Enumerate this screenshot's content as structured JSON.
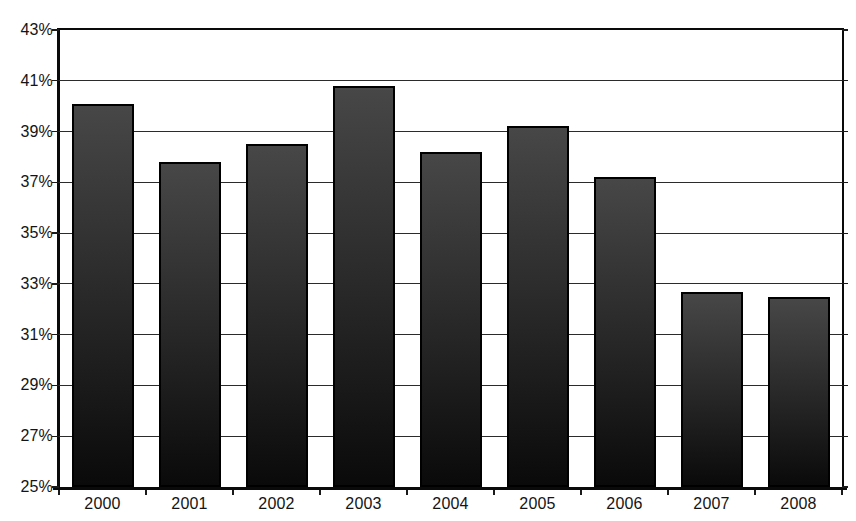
{
  "chart_data": {
    "type": "bar",
    "title": "",
    "xlabel": "",
    "ylabel": "",
    "categories": [
      "2000",
      "2001",
      "2002",
      "2003",
      "2004",
      "2005",
      "2006",
      "2007",
      "2008"
    ],
    "values": [
      40.1,
      37.8,
      38.5,
      40.8,
      38.2,
      39.2,
      37.2,
      32.7,
      32.5
    ],
    "ylim": [
      25,
      43
    ],
    "ytick_step": 2,
    "ytick_labels": [
      "25%",
      "27%",
      "29%",
      "31%",
      "33%",
      "35%",
      "37%",
      "39%",
      "41%",
      "43%"
    ],
    "grid": true,
    "legend": false,
    "colors": {
      "background": "#ffffff",
      "bar_gradient_top": "#474747",
      "bar_gradient_bottom": "#0a0a0a",
      "bar_border": "#000000",
      "axis": "#0a0a0a",
      "gridline": "#2b2b2b",
      "label_text": "#141414"
    }
  }
}
